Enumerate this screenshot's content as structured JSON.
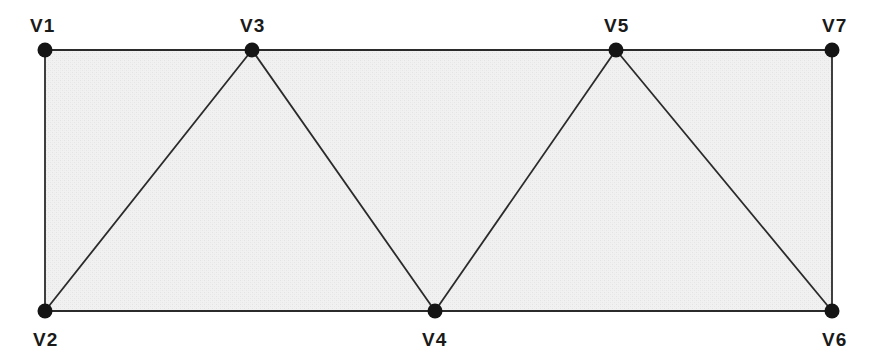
{
  "figure": {
    "type": "truss-diagram",
    "title": "",
    "canvas": {
      "width": 880,
      "height": 364
    },
    "colors": {
      "background": "#ffffff",
      "fill": "#f0f0f0",
      "stroke": "#2b2b2b",
      "node": "#151515",
      "label": "#1a1a1a"
    },
    "style": {
      "edge_stroke_width": 1.8,
      "node_radius": 7.5,
      "fill_texture": "light-gray-dither"
    }
  },
  "nodes": [
    {
      "id": "V1",
      "label": "V1",
      "x": 45,
      "y": 50,
      "label_x": 30,
      "label_y": 16,
      "label_anchor": "above-left"
    },
    {
      "id": "V2",
      "label": "V2",
      "x": 45,
      "y": 311,
      "label_x": 33,
      "label_y": 330,
      "label_anchor": "below-left"
    },
    {
      "id": "V3",
      "label": "V3",
      "x": 252,
      "y": 50,
      "label_x": 240,
      "label_y": 16,
      "label_anchor": "above"
    },
    {
      "id": "V4",
      "label": "V4",
      "x": 435,
      "y": 311,
      "label_x": 422,
      "label_y": 330,
      "label_anchor": "below"
    },
    {
      "id": "V5",
      "label": "V5",
      "x": 616,
      "y": 50,
      "label_x": 604,
      "label_y": 16,
      "label_anchor": "above"
    },
    {
      "id": "V6",
      "label": "V6",
      "x": 832,
      "y": 311,
      "label_x": 822,
      "label_y": 330,
      "label_anchor": "below-right"
    },
    {
      "id": "V7",
      "label": "V7",
      "x": 832,
      "y": 50,
      "label_x": 822,
      "label_y": 16,
      "label_anchor": "above-right"
    }
  ],
  "edges": [
    {
      "from": "V1",
      "to": "V3",
      "kind": "top-chord"
    },
    {
      "from": "V3",
      "to": "V5",
      "kind": "top-chord"
    },
    {
      "from": "V5",
      "to": "V7",
      "kind": "top-chord"
    },
    {
      "from": "V2",
      "to": "V4",
      "kind": "bottom-chord"
    },
    {
      "from": "V4",
      "to": "V6",
      "kind": "bottom-chord"
    },
    {
      "from": "V1",
      "to": "V2",
      "kind": "left-end-post"
    },
    {
      "from": "V7",
      "to": "V6",
      "kind": "right-end-post"
    },
    {
      "from": "V2",
      "to": "V3",
      "kind": "diagonal"
    },
    {
      "from": "V3",
      "to": "V4",
      "kind": "diagonal"
    },
    {
      "from": "V4",
      "to": "V5",
      "kind": "diagonal"
    },
    {
      "from": "V5",
      "to": "V6",
      "kind": "diagonal"
    }
  ],
  "region": {
    "name": "shaded-interior",
    "outline": [
      "V1",
      "V3",
      "V5",
      "V7",
      "V6",
      "V4",
      "V2"
    ]
  }
}
